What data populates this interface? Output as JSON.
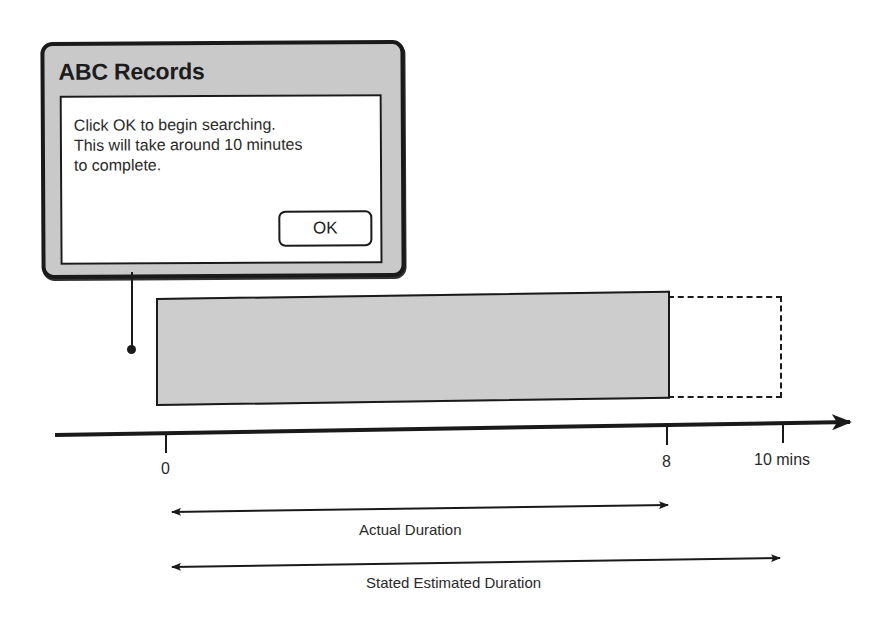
{
  "dialog": {
    "title": "ABC Records",
    "message_lines": [
      "Click OK to begin searching.",
      "This will take around 10 minutes",
      "to complete."
    ],
    "ok_label": "OK"
  },
  "timeline": {
    "ticks": [
      {
        "value": 0,
        "label": "0"
      },
      {
        "value": 8,
        "label": "8"
      },
      {
        "value": 10,
        "label": "10 mins"
      }
    ],
    "unit": "mins"
  },
  "bars": {
    "actual": {
      "start": 0,
      "end": 8,
      "style": "solid-gray"
    },
    "estimated_extension": {
      "start": 8,
      "end": 10,
      "style": "dashed-outline"
    }
  },
  "durations": {
    "actual_label": "Actual Duration",
    "stated_label": "Stated Estimated Duration"
  },
  "colors": {
    "dialog_frame": "#c9c9c9",
    "bar_fill": "#cdcdcd",
    "ink": "#1a1a1a"
  }
}
